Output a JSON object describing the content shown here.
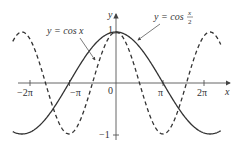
{
  "chart_data": {
    "type": "line",
    "title": "",
    "xlabel": "x",
    "ylabel": "y",
    "xlim": [
      -6.9,
      7.0
    ],
    "ylim": [
      -1.05,
      1.4
    ],
    "grid": false,
    "x_ticks": [
      "-2π",
      "-π",
      "0",
      "π",
      "2π"
    ],
    "x_tick_values": [
      -6.2832,
      -3.1416,
      0,
      3.1416,
      6.2832
    ],
    "y_ticks": [
      "1",
      "-1"
    ],
    "y_tick_values": [
      1,
      -1
    ],
    "series": [
      {
        "name": "y = cos x",
        "style": "dashed",
        "function": "cos(x)"
      },
      {
        "name": "y = cos x/2",
        "style": "solid",
        "function": "cos(x/2)"
      }
    ],
    "annotations": [
      {
        "text": "y = cos x",
        "points_to": "dashed curve"
      },
      {
        "text": "y = cos x/2",
        "points_to": "solid curve"
      }
    ]
  },
  "labels": {
    "x_axis": "x",
    "y_axis": "y",
    "origin": "0",
    "neg_two_pi": "−2π",
    "neg_pi": "−π",
    "pi": "π",
    "two_pi": "2π",
    "y_one": "1",
    "y_neg_one": "−1",
    "cosx_label": "y = cos x",
    "cosx2_label_prefix": "y = cos",
    "cosx2_num": "x",
    "cosx2_den": "2"
  },
  "colors": {
    "curve": "#333333",
    "axis": "#444444",
    "background": "#ffffff"
  }
}
